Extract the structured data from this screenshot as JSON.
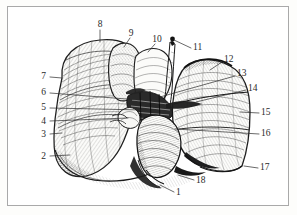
{
  "figure": {
    "kind": "engraved-anatomical-plate",
    "style": "cross-hatched line engraving",
    "background_color": "#ffffff",
    "frame_color": "#a9a9a9",
    "ink_color": "#2a2a2a",
    "paper_color": "#fdfdfb"
  },
  "labels": [
    {
      "id": "1",
      "text": "1",
      "x": 176,
      "y": 193,
      "align": "l",
      "leader": [
        [
          174,
          192
        ],
        [
          160,
          185
        ]
      ]
    },
    {
      "id": "2",
      "text": "2",
      "x": 46,
      "y": 157,
      "align": "r",
      "leader": [
        [
          50,
          156
        ],
        [
          70,
          155
        ]
      ]
    },
    {
      "id": "3",
      "text": "3",
      "x": 46,
      "y": 135,
      "align": "r",
      "leader": [
        [
          50,
          134
        ],
        [
          62,
          133
        ]
      ]
    },
    {
      "id": "4",
      "text": "4",
      "x": 46,
      "y": 122,
      "align": "r",
      "leader": [
        [
          50,
          121
        ],
        [
          128,
          118
        ]
      ]
    },
    {
      "id": "5",
      "text": "5",
      "x": 46,
      "y": 108,
      "align": "r",
      "leader": [
        [
          50,
          108
        ],
        [
          143,
          110
        ]
      ]
    },
    {
      "id": "6",
      "text": "6",
      "x": 46,
      "y": 93,
      "align": "r",
      "leader": [
        [
          50,
          93
        ],
        [
          139,
          100
        ]
      ]
    },
    {
      "id": "7",
      "text": "7",
      "x": 46,
      "y": 77,
      "align": "r",
      "leader": [
        [
          50,
          77
        ],
        [
          62,
          78
        ]
      ]
    },
    {
      "id": "8",
      "text": "8",
      "x": 100,
      "y": 25,
      "align": "c",
      "leader": [
        [
          100,
          30
        ],
        [
          100,
          42
        ]
      ]
    },
    {
      "id": "9",
      "text": "9",
      "x": 131,
      "y": 34,
      "align": "c",
      "leader": [
        [
          130,
          38
        ],
        [
          124,
          47
        ]
      ]
    },
    {
      "id": "10",
      "text": "10",
      "x": 157,
      "y": 40,
      "align": "c",
      "leader": [
        [
          155,
          44
        ],
        [
          148,
          52
        ]
      ]
    },
    {
      "id": "11",
      "text": "11",
      "x": 193,
      "y": 48,
      "align": "l",
      "leader": [
        [
          191,
          48
        ],
        [
          174,
          40
        ]
      ]
    },
    {
      "id": "12",
      "text": "12",
      "x": 224,
      "y": 60,
      "align": "l",
      "leader": [
        [
          222,
          62
        ],
        [
          210,
          70
        ]
      ]
    },
    {
      "id": "13",
      "text": "13",
      "x": 237,
      "y": 74,
      "align": "l",
      "leader": [
        [
          235,
          76
        ],
        [
          160,
          97
        ]
      ]
    },
    {
      "id": "14",
      "text": "14",
      "x": 248,
      "y": 89,
      "align": "l",
      "leader": [
        [
          246,
          90
        ],
        [
          196,
          102
        ]
      ]
    },
    {
      "id": "15",
      "text": "15",
      "x": 261,
      "y": 113,
      "align": "l",
      "leader": [
        [
          259,
          113
        ],
        [
          240,
          112
        ]
      ]
    },
    {
      "id": "16",
      "text": "16",
      "x": 261,
      "y": 134,
      "align": "l",
      "leader": [
        [
          259,
          134
        ],
        [
          175,
          129
        ]
      ]
    },
    {
      "id": "17",
      "text": "17",
      "x": 260,
      "y": 168,
      "align": "l",
      "leader": [
        [
          258,
          168
        ],
        [
          244,
          166
        ]
      ]
    },
    {
      "id": "18",
      "text": "18",
      "x": 196,
      "y": 181,
      "align": "l",
      "leader": [
        [
          194,
          180
        ],
        [
          178,
          175
        ]
      ]
    }
  ]
}
